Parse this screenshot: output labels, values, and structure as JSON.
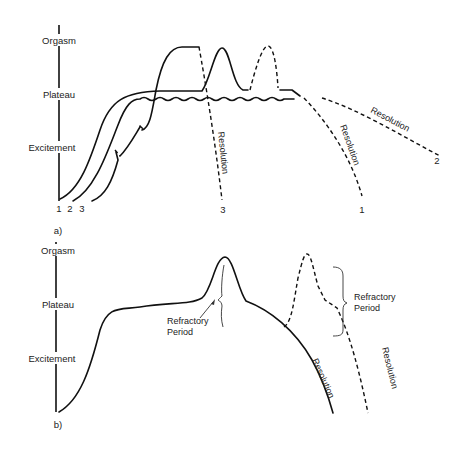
{
  "panel_a": {
    "label": "a)",
    "axis_labels": {
      "orgasm": "Orgasm",
      "plateau": "Plateau",
      "excitement": "Excitement"
    },
    "curve_start_labels": [
      "1",
      "2",
      "3"
    ],
    "curve_end_labels": {
      "curve3": "3",
      "curve1": "1",
      "curve2": "2"
    },
    "phase_labels": {
      "resolution_3": "Resolution",
      "resolution_1": "Resolution",
      "resolution_2": "Resolution"
    }
  },
  "panel_b": {
    "label": "b)",
    "axis_labels": {
      "orgasm": "Orgasm",
      "plateau": "Plateau",
      "excitement": "Excitement"
    },
    "annotations": {
      "refractory_1_line1": "Refractory",
      "refractory_1_line2": "Period",
      "refractory_2_line1": "Refractory",
      "refractory_2_line2": "Period"
    },
    "phase_labels": {
      "resolution_solid": "Resolution",
      "resolution_dashed": "Resolution"
    }
  },
  "colors": {
    "line": "#111111",
    "background": "#ffffff"
  }
}
